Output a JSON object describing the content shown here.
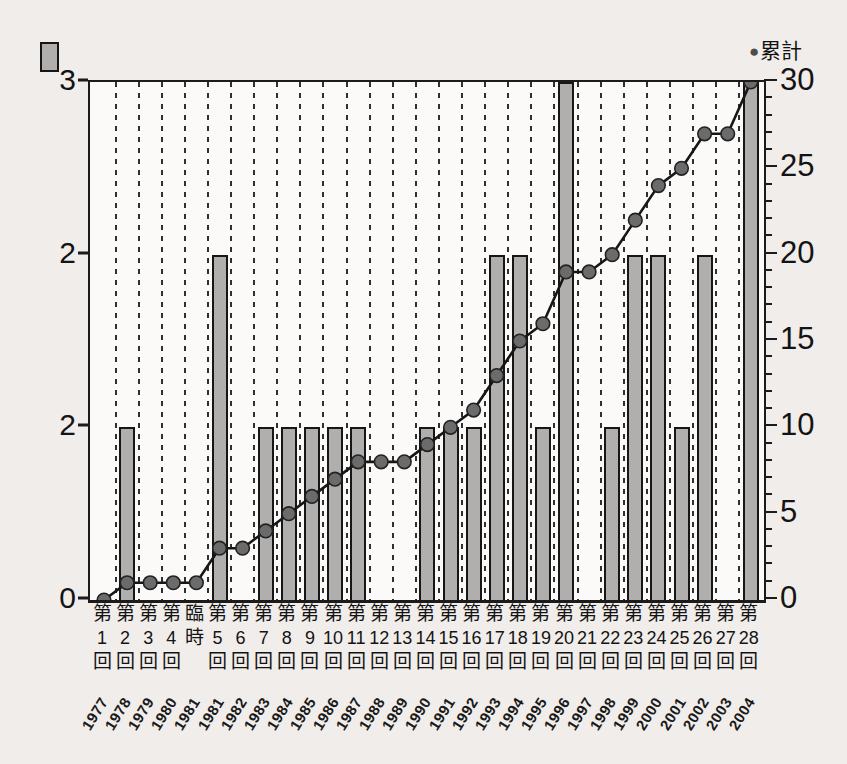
{
  "page": {
    "background": "#f1edea"
  },
  "legend": {
    "dot_icon": "●",
    "line_label": "累計",
    "bar_swatch_color": "#b0afad"
  },
  "colors": {
    "bar_fill": "#b0afad",
    "bar_border": "#161616",
    "line": "#161616",
    "dot_fill": "#6b6b6b",
    "dot_border": "#222222",
    "axis": "#1b1b1b",
    "grid": "#2f2f2f",
    "label": "#141414"
  },
  "chart_data": {
    "type": "bar+line",
    "title": "",
    "categories": [
      {
        "label": "第1回",
        "stack": [
          "第",
          "1",
          "回"
        ],
        "year": "1977"
      },
      {
        "label": "第2回",
        "stack": [
          "第",
          "2",
          "回"
        ],
        "year": "1978"
      },
      {
        "label": "第3回",
        "stack": [
          "第",
          "3",
          "回"
        ],
        "year": "1979"
      },
      {
        "label": "第4回",
        "stack": [
          "第",
          "4",
          "回"
        ],
        "year": "1980"
      },
      {
        "label": "臨時",
        "stack": [
          "臨",
          "時",
          ""
        ],
        "year": "1981"
      },
      {
        "label": "第5回",
        "stack": [
          "第",
          "5",
          "回"
        ],
        "year": "1981"
      },
      {
        "label": "第6回",
        "stack": [
          "第",
          "6",
          "回"
        ],
        "year": "1982"
      },
      {
        "label": "第7回",
        "stack": [
          "第",
          "7",
          "回"
        ],
        "year": "1983"
      },
      {
        "label": "第8回",
        "stack": [
          "第",
          "8",
          "回"
        ],
        "year": "1984"
      },
      {
        "label": "第9回",
        "stack": [
          "第",
          "9",
          "回"
        ],
        "year": "1985"
      },
      {
        "label": "第10回",
        "stack": [
          "第",
          "10",
          "回"
        ],
        "year": "1986"
      },
      {
        "label": "第11回",
        "stack": [
          "第",
          "11",
          "回"
        ],
        "year": "1987"
      },
      {
        "label": "第12回",
        "stack": [
          "第",
          "12",
          "回"
        ],
        "year": "1988"
      },
      {
        "label": "第13回",
        "stack": [
          "第",
          "13",
          "回"
        ],
        "year": "1989"
      },
      {
        "label": "第14回",
        "stack": [
          "第",
          "14",
          "回"
        ],
        "year": "1990"
      },
      {
        "label": "第15回",
        "stack": [
          "第",
          "15",
          "回"
        ],
        "year": "1991"
      },
      {
        "label": "第16回",
        "stack": [
          "第",
          "16",
          "回"
        ],
        "year": "1992"
      },
      {
        "label": "第17回",
        "stack": [
          "第",
          "17",
          "回"
        ],
        "year": "1993"
      },
      {
        "label": "第18回",
        "stack": [
          "第",
          "18",
          "回"
        ],
        "year": "1994"
      },
      {
        "label": "第19回",
        "stack": [
          "第",
          "19",
          "回"
        ],
        "year": "1995"
      },
      {
        "label": "第20回",
        "stack": [
          "第",
          "20",
          "回"
        ],
        "year": "1996"
      },
      {
        "label": "第21回",
        "stack": [
          "第",
          "21",
          "回"
        ],
        "year": "1997"
      },
      {
        "label": "第22回",
        "stack": [
          "第",
          "22",
          "回"
        ],
        "year": "1998"
      },
      {
        "label": "第23回",
        "stack": [
          "第",
          "23",
          "回"
        ],
        "year": "1999"
      },
      {
        "label": "第24回",
        "stack": [
          "第",
          "24",
          "回"
        ],
        "year": "2000"
      },
      {
        "label": "第25回",
        "stack": [
          "第",
          "25",
          "回"
        ],
        "year": "2001"
      },
      {
        "label": "第26回",
        "stack": [
          "第",
          "26",
          "回"
        ],
        "year": "2002"
      },
      {
        "label": "第27回",
        "stack": [
          "第",
          "27",
          "回"
        ],
        "year": "2003"
      },
      {
        "label": "第28回",
        "stack": [
          "第",
          "28",
          "回"
        ],
        "year": "2004"
      }
    ],
    "series": [
      {
        "name": "",
        "type": "bar",
        "legend": "gray bar swatch (top-left, unlabeled)",
        "values": [
          0,
          1,
          0,
          0,
          0,
          2,
          0,
          1,
          1,
          1,
          1,
          1,
          0,
          0,
          1,
          1,
          1,
          2,
          2,
          1,
          3,
          0,
          1,
          2,
          2,
          1,
          2,
          0,
          3
        ]
      },
      {
        "name": "累計",
        "type": "line",
        "legend": "● 累計 (top-right)",
        "values": [
          0,
          1,
          1,
          1,
          1,
          3,
          3,
          4,
          5,
          6,
          7,
          8,
          8,
          8,
          9,
          10,
          11,
          13,
          15,
          16,
          19,
          19,
          20,
          22,
          24,
          25,
          27,
          27,
          30
        ]
      }
    ],
    "left_axis": {
      "tick_labels_bottom_to_top": [
        "0",
        "2",
        "2",
        "3"
      ],
      "implied_values": [
        0,
        1,
        2,
        3
      ],
      "range": [
        0,
        3
      ]
    },
    "right_axis": {
      "title": "累計",
      "tick_labels_bottom_to_top": [
        "0",
        "5",
        "10",
        "15",
        "20",
        "25",
        "30"
      ],
      "major_tick_values": [
        0,
        5,
        10,
        15,
        20,
        25,
        30
      ],
      "minor_tick_step": 1,
      "range": [
        0,
        30
      ]
    },
    "grid": "vertical dashed lines at boundaries between categories",
    "legend_position": "bar swatch top-left; 累計 dot legend top-right"
  }
}
